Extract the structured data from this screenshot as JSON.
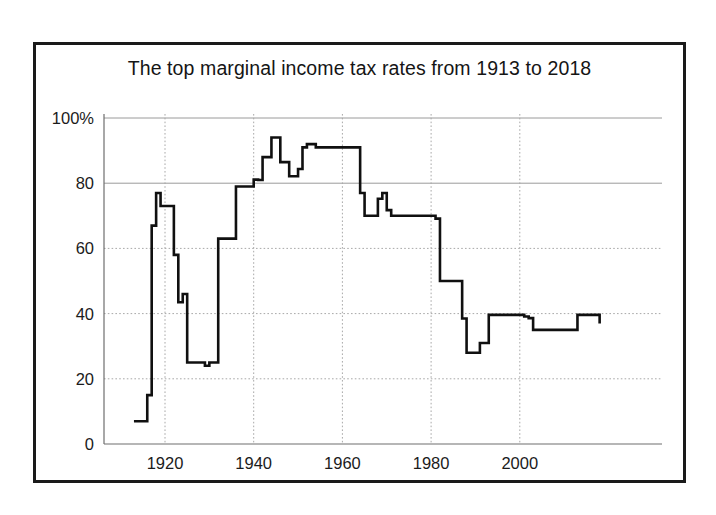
{
  "figure": {
    "border_color": "#1a1a1a",
    "background": "#ffffff"
  },
  "chart_data": {
    "type": "line",
    "title": "The top marginal income tax rates from 1913 to 2018",
    "xlabel": "",
    "ylabel": "",
    "xlim": [
      1913,
      2018
    ],
    "ylim": [
      0,
      100
    ],
    "grid": true,
    "legend": "none",
    "line_color": "#101010",
    "line_width": 2.6,
    "xticks": [
      1920,
      1940,
      1960,
      1980,
      2000
    ],
    "xtick_labels": [
      "1920",
      "1940",
      "1960",
      "1980",
      "2000"
    ],
    "yticks": [
      0,
      20,
      40,
      60,
      80,
      100
    ],
    "ytick_labels": [
      "0",
      "20",
      "40",
      "60",
      "80",
      "100%"
    ],
    "series": [
      {
        "name": "Top marginal income tax rate",
        "x": [
          1913,
          1914,
          1915,
          1916,
          1917,
          1918,
          1919,
          1920,
          1921,
          1922,
          1923,
          1924,
          1925,
          1926,
          1927,
          1928,
          1929,
          1930,
          1931,
          1932,
          1933,
          1934,
          1935,
          1936,
          1937,
          1938,
          1939,
          1940,
          1941,
          1942,
          1943,
          1944,
          1945,
          1946,
          1947,
          1948,
          1949,
          1950,
          1951,
          1952,
          1953,
          1954,
          1955,
          1956,
          1957,
          1958,
          1959,
          1960,
          1961,
          1962,
          1963,
          1964,
          1965,
          1966,
          1967,
          1968,
          1969,
          1970,
          1971,
          1972,
          1973,
          1974,
          1975,
          1976,
          1977,
          1978,
          1979,
          1980,
          1981,
          1982,
          1983,
          1984,
          1985,
          1986,
          1987,
          1988,
          1989,
          1990,
          1991,
          1992,
          1993,
          1994,
          1995,
          1996,
          1997,
          1998,
          1999,
          2000,
          2001,
          2002,
          2003,
          2004,
          2005,
          2006,
          2007,
          2008,
          2009,
          2010,
          2011,
          2012,
          2013,
          2014,
          2015,
          2016,
          2017,
          2018
        ],
        "y": [
          7,
          7,
          7,
          15,
          67,
          77,
          73,
          73,
          73,
          58,
          43.5,
          46,
          25,
          25,
          25,
          25,
          24,
          25,
          25,
          63,
          63,
          63,
          63,
          79,
          79,
          79,
          79,
          81.1,
          81,
          88,
          88,
          94,
          94,
          86.45,
          86.45,
          82.13,
          82.13,
          84.36,
          91,
          92,
          92,
          91,
          91,
          91,
          91,
          91,
          91,
          91,
          91,
          91,
          91,
          77,
          70,
          70,
          70,
          75.25,
          77,
          71.75,
          70,
          70,
          70,
          70,
          70,
          70,
          70,
          70,
          70,
          70,
          69.13,
          50,
          50,
          50,
          50,
          50,
          38.5,
          28,
          28,
          28,
          31,
          31,
          39.6,
          39.6,
          39.6,
          39.6,
          39.6,
          39.6,
          39.6,
          39.6,
          39.1,
          38.6,
          35,
          35,
          35,
          35,
          35,
          35,
          35,
          35,
          35,
          35,
          39.6,
          39.6,
          39.6,
          39.6,
          39.6,
          37
        ],
        "annotations": [
          {
            "year": 1918,
            "value": 77,
            "note": "WWI peak"
          },
          {
            "year": 1944,
            "value": 94,
            "note": "WWII peak"
          },
          {
            "year": 1964,
            "value": 77,
            "note": "Kennedy tax cut begins"
          },
          {
            "year": 1969,
            "value": 77,
            "note": "Surcharge bump"
          },
          {
            "year": 1988,
            "value": 28,
            "note": "Post-1986 reform low"
          },
          {
            "year": 2018,
            "value": 37,
            "note": "Current rate"
          }
        ]
      }
    ]
  }
}
